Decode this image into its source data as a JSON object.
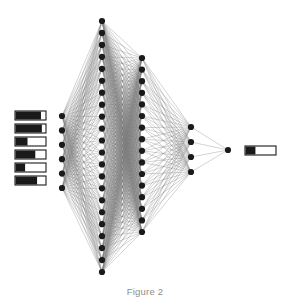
{
  "figure": {
    "caption": "Figure 2",
    "background_color": "#ffffff",
    "node_color": "#1a1a1a",
    "edge_color": "#7a7a7a",
    "bar_fill_color": "#1a1a1a",
    "bar_border_color": "#1a1a1a",
    "bar_empty_color": "#ffffff"
  },
  "chart_data": {
    "type": "diagram",
    "title": "Figure 2",
    "subtype": "feedforward-neural-network",
    "layers": [
      {
        "name": "input",
        "node_count": 6,
        "x": 62,
        "y_top": 116,
        "y_bottom": 188,
        "spacing": 14.4
      },
      {
        "name": "hidden-1",
        "node_count": 22,
        "x": 102,
        "y_top": 21,
        "y_bottom": 272,
        "spacing": 11.95
      },
      {
        "name": "hidden-2",
        "node_count": 16,
        "x": 142,
        "y_top": 58,
        "y_bottom": 232,
        "spacing": 11.6
      },
      {
        "name": "hidden-3",
        "node_count": 4,
        "x": 191,
        "y_top": 127,
        "y_bottom": 172,
        "spacing": 15.0
      },
      {
        "name": "output",
        "node_count": 1,
        "x": 228,
        "y_top": 150,
        "y_bottom": 150,
        "spacing": 0
      }
    ],
    "node_radius": 3.1,
    "input_bars": {
      "label": "input feature bars",
      "x": 15,
      "width": 31,
      "height": 9,
      "y_positions": [
        111,
        124,
        137,
        150,
        163,
        176
      ],
      "fill_fractions": [
        0.85,
        0.88,
        0.4,
        0.66,
        0.32,
        0.72
      ]
    },
    "output_bar": {
      "label": "output value bar",
      "x": 245,
      "y": 146,
      "width": 31,
      "height": 9,
      "fill_fraction": 0.33
    },
    "edges": {
      "input_to_hidden1": "fully-connected",
      "hidden1_to_hidden2": "fully-connected",
      "hidden2_to_hidden3": "fully-connected",
      "hidden3_to_output": "fully-connected",
      "stroke_width": 0.45
    },
    "xlabel": "",
    "ylabel": "",
    "grid": false,
    "legend": null
  }
}
